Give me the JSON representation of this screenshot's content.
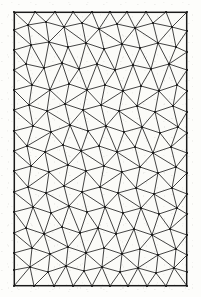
{
  "figure": {
    "kind": "triangulated-mesh-diagram",
    "page": {
      "width": 201,
      "height": 297,
      "background_color": "#fdfdfb"
    },
    "frame": {
      "x": 14,
      "y": 12,
      "width": 173,
      "height": 274,
      "stroke_color": "#1a1a1a",
      "stroke_width": 1.1,
      "fill_color": "#fbfbf8"
    },
    "style": {
      "edge_color": "#222222",
      "edge_width": 0.85,
      "vertex_color": "#111111",
      "vertex_radius": 0.9,
      "show_vertices": true
    },
    "counts": {
      "vertices": 132,
      "edges": 366,
      "triangles": 0
    },
    "mesh": {
      "points": [
        [
          14,
          12
        ],
        [
          35,
          12
        ],
        [
          55,
          12
        ],
        [
          73,
          12
        ],
        [
          92,
          12
        ],
        [
          110,
          12
        ],
        [
          127,
          12
        ],
        [
          146,
          12
        ],
        [
          166,
          12
        ],
        [
          187,
          12
        ],
        [
          14,
          30
        ],
        [
          28,
          25
        ],
        [
          46,
          22
        ],
        [
          64,
          27
        ],
        [
          82,
          23
        ],
        [
          99,
          29
        ],
        [
          117,
          24
        ],
        [
          135,
          28
        ],
        [
          153,
          23
        ],
        [
          172,
          27
        ],
        [
          187,
          31
        ],
        [
          14,
          50
        ],
        [
          31,
          45
        ],
        [
          49,
          42
        ],
        [
          68,
          47
        ],
        [
          86,
          43
        ],
        [
          104,
          49
        ],
        [
          122,
          44
        ],
        [
          140,
          48
        ],
        [
          158,
          43
        ],
        [
          176,
          47
        ],
        [
          187,
          52
        ],
        [
          14,
          70
        ],
        [
          26,
          64
        ],
        [
          44,
          68
        ],
        [
          62,
          63
        ],
        [
          79,
          69
        ],
        [
          97,
          64
        ],
        [
          115,
          70
        ],
        [
          133,
          65
        ],
        [
          151,
          69
        ],
        [
          169,
          64
        ],
        [
          187,
          70
        ],
        [
          14,
          90
        ],
        [
          32,
          85
        ],
        [
          50,
          90
        ],
        [
          69,
          84
        ],
        [
          87,
          90
        ],
        [
          105,
          85
        ],
        [
          123,
          91
        ],
        [
          141,
          86
        ],
        [
          159,
          91
        ],
        [
          177,
          85
        ],
        [
          187,
          91
        ],
        [
          14,
          110
        ],
        [
          29,
          105
        ],
        [
          47,
          111
        ],
        [
          65,
          104
        ],
        [
          83,
          110
        ],
        [
          101,
          105
        ],
        [
          119,
          111
        ],
        [
          137,
          106
        ],
        [
          155,
          112
        ],
        [
          173,
          106
        ],
        [
          187,
          112
        ],
        [
          14,
          131
        ],
        [
          33,
          126
        ],
        [
          51,
          132
        ],
        [
          70,
          125
        ],
        [
          88,
          131
        ],
        [
          106,
          126
        ],
        [
          124,
          132
        ],
        [
          142,
          127
        ],
        [
          160,
          133
        ],
        [
          178,
          127
        ],
        [
          187,
          133
        ],
        [
          14,
          151
        ],
        [
          27,
          146
        ],
        [
          45,
          152
        ],
        [
          63,
          145
        ],
        [
          81,
          151
        ],
        [
          99,
          146
        ],
        [
          117,
          152
        ],
        [
          135,
          147
        ],
        [
          153,
          153
        ],
        [
          171,
          147
        ],
        [
          187,
          153
        ],
        [
          14,
          171
        ],
        [
          31,
          166
        ],
        [
          49,
          172
        ],
        [
          68,
          165
        ],
        [
          86,
          171
        ],
        [
          104,
          166
        ],
        [
          122,
          172
        ],
        [
          140,
          167
        ],
        [
          158,
          173
        ],
        [
          176,
          167
        ],
        [
          187,
          173
        ],
        [
          14,
          192
        ],
        [
          28,
          187
        ],
        [
          46,
          193
        ],
        [
          64,
          186
        ],
        [
          82,
          192
        ],
        [
          100,
          187
        ],
        [
          118,
          193
        ],
        [
          136,
          188
        ],
        [
          154,
          194
        ],
        [
          172,
          188
        ],
        [
          187,
          194
        ],
        [
          14,
          212
        ],
        [
          33,
          207
        ],
        [
          51,
          213
        ],
        [
          69,
          206
        ],
        [
          87,
          212
        ],
        [
          105,
          207
        ],
        [
          123,
          213
        ],
        [
          141,
          208
        ],
        [
          159,
          214
        ],
        [
          177,
          208
        ],
        [
          187,
          214
        ],
        [
          14,
          233
        ],
        [
          26,
          228
        ],
        [
          44,
          234
        ],
        [
          62,
          227
        ],
        [
          80,
          233
        ],
        [
          98,
          228
        ],
        [
          116,
          234
        ],
        [
          134,
          229
        ],
        [
          152,
          235
        ],
        [
          170,
          229
        ],
        [
          187,
          235
        ],
        [
          14,
          253
        ],
        [
          32,
          248
        ],
        [
          50,
          254
        ],
        [
          68,
          247
        ],
        [
          86,
          253
        ],
        [
          104,
          248
        ],
        [
          122,
          254
        ],
        [
          140,
          249
        ],
        [
          158,
          255
        ],
        [
          176,
          249
        ],
        [
          187,
          255
        ],
        [
          14,
          270
        ],
        [
          30,
          267
        ],
        [
          48,
          272
        ],
        [
          66,
          266
        ],
        [
          84,
          271
        ],
        [
          102,
          267
        ],
        [
          120,
          272
        ],
        [
          138,
          268
        ],
        [
          156,
          273
        ],
        [
          174,
          268
        ],
        [
          187,
          272
        ],
        [
          14,
          286
        ],
        [
          34,
          286
        ],
        [
          54,
          286
        ],
        [
          73,
          286
        ],
        [
          92,
          286
        ],
        [
          110,
          286
        ],
        [
          128,
          286
        ],
        [
          147,
          286
        ],
        [
          166,
          286
        ],
        [
          187,
          286
        ]
      ]
    }
  }
}
